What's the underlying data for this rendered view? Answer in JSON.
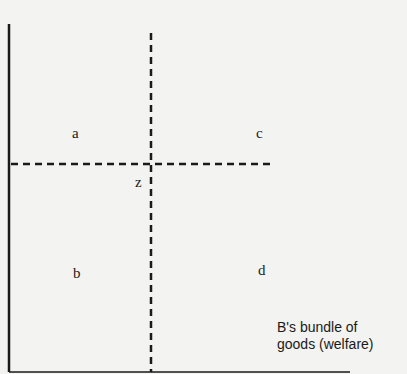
{
  "diagram": {
    "type": "quadrant-welfare-diagram",
    "quadrant_labels": {
      "a": "a",
      "b": "b",
      "c": "c",
      "d": "d"
    },
    "center_point_label": "z",
    "x_axis_label_line1": "B's bundle of",
    "x_axis_label_line2": "goods (welfare)",
    "colors": {
      "background": "#f3f3f1",
      "ink": "#1a1a1a"
    }
  }
}
